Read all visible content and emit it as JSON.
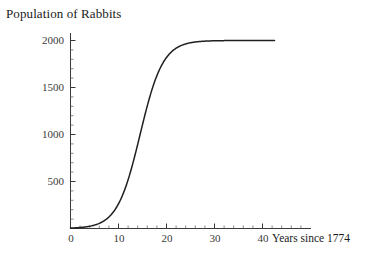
{
  "chart_data": {
    "type": "line",
    "title": "Population of Rabbits",
    "xlabel": "Years since 1774",
    "ylabel": "",
    "xlim": [
      0,
      44
    ],
    "ylim": [
      0,
      2100
    ],
    "grid": false,
    "legend": "none",
    "annotations": [],
    "model": "logistic growth: P(t) = 2000 / (1 + exp(-0.42*(t - 14.5)))",
    "carrying_capacity": 2000,
    "x_ticks": [
      0,
      10,
      20,
      30,
      40
    ],
    "x_tick_labels": [
      "0",
      "10",
      "20",
      "30",
      "40"
    ],
    "x_minor_tick_step": 2,
    "y_ticks": [
      500,
      1000,
      1500,
      2000
    ],
    "y_tick_labels": [
      "500",
      "1000",
      "1500",
      "2000"
    ],
    "y_minor_tick_step": 100,
    "series": [
      {
        "name": "Population of Rabbits",
        "color": "#1f1f1f",
        "x": [
          0,
          1,
          2,
          3,
          4,
          5,
          6,
          7,
          8,
          9,
          10,
          11,
          12,
          13,
          14,
          15,
          16,
          17,
          18,
          19,
          20,
          21,
          22,
          23,
          24,
          25,
          26,
          27,
          28,
          29,
          30,
          31,
          32,
          33,
          34,
          35,
          36,
          37,
          38,
          39,
          40,
          41,
          42
        ],
        "values": [
          5,
          8,
          12,
          18,
          27,
          41,
          61,
          91,
          135,
          198,
          288,
          412,
          576,
          779,
          1012,
          1255,
          1486,
          1682,
          1829,
          1930,
          1993,
          2030,
          2050,
          2061,
          2067,
          2070,
          2072,
          2073,
          2074,
          2074,
          2074,
          2074,
          2074,
          2074,
          2074,
          2074,
          2074,
          2074,
          2074,
          2074,
          2074,
          2074,
          2074
        ]
      }
    ]
  },
  "chart": {
    "title": "Population of Rabbits",
    "xaxis_label": "Years since 1774",
    "y_tick_labels": [
      "2000",
      "1500",
      "1000",
      "500"
    ],
    "x_tick_labels": [
      "0",
      "10",
      "20",
      "30",
      "40"
    ]
  }
}
